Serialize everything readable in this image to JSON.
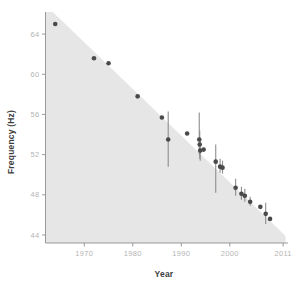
{
  "chart_data": {
    "type": "scatter",
    "title": "",
    "xlabel": "Year",
    "ylabel": "Frequency (Hz)",
    "xlim": [
      1962,
      2012
    ],
    "ylim": [
      43.2,
      66.2
    ],
    "xticks": [
      1970,
      1980,
      1990,
      2000,
      2011
    ],
    "xtick_labels": [
      "1970",
      "1980",
      "1990",
      "2000",
      "2011"
    ],
    "yticks": [
      44,
      48,
      52,
      56,
      60,
      64
    ],
    "ytick_labels": [
      "44",
      "48",
      "52",
      "56",
      "60",
      "64"
    ],
    "grid": false,
    "legend": null,
    "marker_color": "#4a4a4a",
    "errorbar_color": "#8d8d8d",
    "band_color": "#e6e6e6",
    "axis_color": "#8f8f8f",
    "tick_label_color": "#b4b4b4",
    "axis_title_color": "#3d3d3d",
    "shaded_band": {
      "description": "Grey shaded region above the declining trend, bounded by a straight trend line from upper-left to lower-right",
      "line_start": [
        1963.5,
        66.2
      ],
      "line_end": [
        2011.5,
        43.9
      ]
    },
    "points": [
      {
        "x": 1964.0,
        "y": 65.0,
        "yerr_low": null,
        "yerr_high": null
      },
      {
        "x": 1972.0,
        "y": 61.6,
        "yerr_low": null,
        "yerr_high": null
      },
      {
        "x": 1975.0,
        "y": 61.1,
        "yerr_low": null,
        "yerr_high": null
      },
      {
        "x": 1981.0,
        "y": 57.8,
        "yerr_low": null,
        "yerr_high": null
      },
      {
        "x": 1986.0,
        "y": 55.7,
        "yerr_low": null,
        "yerr_high": null
      },
      {
        "x": 1987.3,
        "y": 53.5,
        "yerr_low": 50.8,
        "yerr_high": 56.3
      },
      {
        "x": 1991.2,
        "y": 54.1,
        "yerr_low": null,
        "yerr_high": null
      },
      {
        "x": 1993.7,
        "y": 53.5,
        "yerr_low": 52.0,
        "yerr_high": 56.2
      },
      {
        "x": 1993.8,
        "y": 53.0,
        "yerr_low": 51.6,
        "yerr_high": 54.4
      },
      {
        "x": 1993.9,
        "y": 52.4,
        "yerr_low": 51.4,
        "yerr_high": 53.4
      },
      {
        "x": 1994.6,
        "y": 52.5,
        "yerr_low": null,
        "yerr_high": null
      },
      {
        "x": 1997.1,
        "y": 51.3,
        "yerr_low": 48.2,
        "yerr_high": 53.0
      },
      {
        "x": 1998.0,
        "y": 50.8,
        "yerr_low": 50.2,
        "yerr_high": 51.6
      },
      {
        "x": 1998.5,
        "y": 50.7,
        "yerr_low": 50.1,
        "yerr_high": 51.4
      },
      {
        "x": 2001.2,
        "y": 48.7,
        "yerr_low": 47.9,
        "yerr_high": 49.6
      },
      {
        "x": 2002.4,
        "y": 48.1,
        "yerr_low": 47.5,
        "yerr_high": 48.8
      },
      {
        "x": 2003.1,
        "y": 47.9,
        "yerr_low": 47.3,
        "yerr_high": 48.6
      },
      {
        "x": 2004.2,
        "y": 47.3,
        "yerr_low": 46.9,
        "yerr_high": 47.8
      },
      {
        "x": 2006.3,
        "y": 46.8,
        "yerr_low": null,
        "yerr_high": null
      },
      {
        "x": 2007.4,
        "y": 46.1,
        "yerr_low": 45.1,
        "yerr_high": 47.2
      },
      {
        "x": 2008.3,
        "y": 45.6,
        "yerr_low": null,
        "yerr_high": null
      }
    ]
  }
}
